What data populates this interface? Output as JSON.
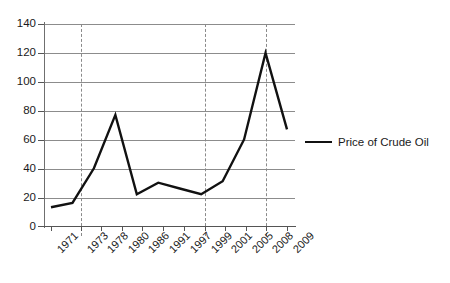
{
  "chart_data": {
    "type": "line",
    "title": "",
    "subtitle": "",
    "xlabel": "",
    "ylabel": "",
    "categories": [
      "1971",
      "1973",
      "1978",
      "1980",
      "1986",
      "1991",
      "1997",
      "1999",
      "2001",
      "2005",
      "2008",
      "2009"
    ],
    "series": [
      {
        "name": "Price of Crude Oil",
        "values": [
          13,
          16,
          40,
          77,
          22,
          30,
          26,
          22,
          31,
          60,
          120,
          67
        ],
        "color": "#111111"
      }
    ],
    "ylim": [
      0,
      140
    ],
    "ytick_labels": [
      "0",
      "20",
      "40",
      "60",
      "80",
      "100",
      "120",
      "140"
    ],
    "ytick_values": [
      0,
      20,
      40,
      60,
      80,
      100,
      120,
      140
    ],
    "grid": "horizontal-solid-and-vertical-dashed",
    "vertical_gridline_categories": [
      "1973",
      "1999",
      "2008"
    ],
    "legend_position": "right",
    "legend_entries": [
      "Price of Crude Oil"
    ],
    "xtick_label_rotation": -45,
    "annotations": []
  },
  "legend": {
    "items": [
      {
        "label": "Price of Crude Oil",
        "swatch": "line-swatch"
      }
    ]
  }
}
